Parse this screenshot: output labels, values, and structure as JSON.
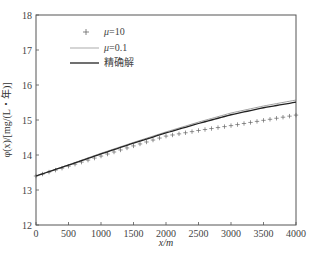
{
  "chart_data": {
    "type": "line",
    "title": "",
    "xlabel": "x/m",
    "ylabel": "φ(x)/[mg/(L・年)]",
    "xlim": [
      0,
      4000
    ],
    "ylim": [
      12,
      18
    ],
    "xticks": [
      0,
      500,
      1000,
      1500,
      2000,
      2500,
      3000,
      3500,
      4000
    ],
    "yticks": [
      12,
      13,
      14,
      15,
      16,
      17,
      18
    ],
    "grid": false,
    "legend_position": "upper-left",
    "x": [
      0,
      500,
      1000,
      1500,
      2000,
      2500,
      3000,
      3500,
      4000
    ],
    "series": [
      {
        "name": "μ=10",
        "style": "markers-plus",
        "values": [
          13.4,
          13.68,
          13.97,
          14.26,
          14.54,
          14.7,
          14.84,
          14.99,
          15.14
        ]
      },
      {
        "name": "μ=0.1",
        "style": "line-thin",
        "values": [
          13.4,
          13.72,
          14.05,
          14.36,
          14.66,
          14.94,
          15.2,
          15.4,
          15.57
        ]
      },
      {
        "name": "精确解",
        "style": "line-thick",
        "values": [
          13.4,
          13.71,
          14.03,
          14.34,
          14.63,
          14.9,
          15.15,
          15.35,
          15.51
        ]
      }
    ]
  },
  "labels": {
    "xlabel": "x/m",
    "ylabel": "φ(x)/[mg/(L・年)]",
    "legend": [
      "μ=10",
      "μ=0.1",
      "精确解"
    ]
  }
}
